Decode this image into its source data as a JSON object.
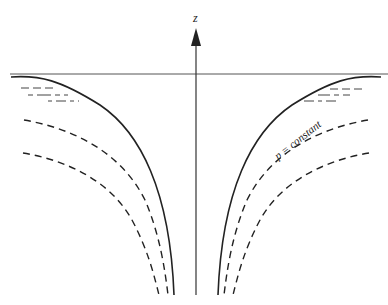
{
  "diagram": {
    "axis_label": "z",
    "curve_label": "p = constant",
    "colors": {
      "line": "#222222",
      "surface": "#555555",
      "background": "#ffffff"
    },
    "elements": [
      "vertical z axis with arrow",
      "horizontal free surface line",
      "solid free-surface curves (left and right)",
      "two dashed constant-pressure curves on each side",
      "short dashed water hatching near top"
    ]
  }
}
